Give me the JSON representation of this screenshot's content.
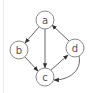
{
  "header": {
    "partial_text": "— — —"
  },
  "graph": {
    "nodes": [
      {
        "id": "a",
        "label": "a",
        "cx": 45,
        "cy": 20
      },
      {
        "id": "b",
        "label": "b",
        "cx": 19,
        "cy": 50
      },
      {
        "id": "c",
        "label": "c",
        "cx": 45,
        "cy": 77
      },
      {
        "id": "d",
        "label": "d",
        "cx": 75,
        "cy": 48
      }
    ],
    "edges": [
      {
        "from": "a",
        "to": "b",
        "style": "straight"
      },
      {
        "from": "a",
        "to": "c",
        "style": "straight"
      },
      {
        "from": "b",
        "to": "c",
        "style": "straight"
      },
      {
        "from": "d",
        "to": "a",
        "style": "straight"
      },
      {
        "from": "c",
        "to": "d",
        "style": "straight"
      },
      {
        "from": "d",
        "to": "c",
        "style": "curved"
      }
    ],
    "colors": {
      "node_stroke": "#8a8a8a",
      "edge": "#555555",
      "label": "#555555",
      "background": "#ffffff"
    }
  }
}
